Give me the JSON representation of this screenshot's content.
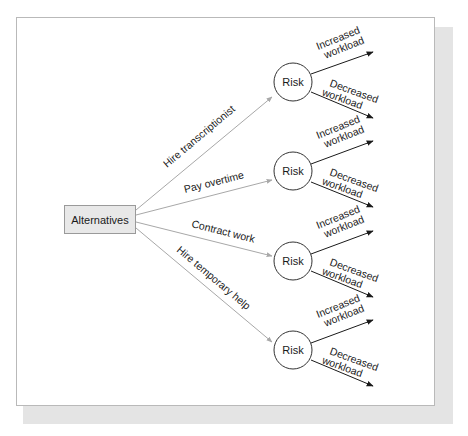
{
  "diagram": {
    "type": "decision-tree",
    "root": {
      "label": "Alternatives"
    },
    "colors": {
      "root_fill": "#e8e8e8",
      "root_border": "#9a9a9a",
      "alternative_line": "#a8a8a8",
      "outcome_line": "#1a1a1a",
      "node_border": "#333333",
      "shadow": "#e4e4e4"
    },
    "alternatives": [
      {
        "label": "Hire transcriptionist",
        "node": "Risk",
        "outcomes": [
          {
            "line1": "Increased",
            "line2": "workload"
          },
          {
            "line1": "Decreased",
            "line2": "workload"
          }
        ]
      },
      {
        "label": "Pay overtime",
        "node": "Risk",
        "outcomes": [
          {
            "line1": "Increased",
            "line2": "workload"
          },
          {
            "line1": "Decreased",
            "line2": "workload"
          }
        ]
      },
      {
        "label": "Contract work",
        "node": "Risk",
        "outcomes": [
          {
            "line1": "Increased",
            "line2": "workload"
          },
          {
            "line1": "Decreased",
            "line2": "workload"
          }
        ]
      },
      {
        "label": "Hire temporary help",
        "node": "Risk",
        "outcomes": [
          {
            "line1": "Increased",
            "line2": "workload"
          },
          {
            "line1": "Decreased",
            "line2": "workload"
          }
        ]
      }
    ]
  }
}
